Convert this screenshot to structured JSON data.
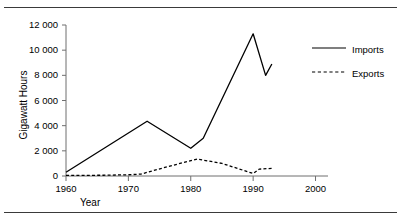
{
  "figure": {
    "top_rule": "",
    "bottom_rule": ""
  },
  "chart_data": {
    "type": "line",
    "title": "",
    "xlabel": "Year",
    "ylabel": "Gigawatt Hours",
    "xlim": [
      1960,
      2002
    ],
    "ylim": [
      0,
      12000
    ],
    "xticks": [
      1960,
      1970,
      1980,
      1990,
      2000
    ],
    "xtick_labels": [
      "1960",
      "1970",
      "1980",
      "1990",
      "2000"
    ],
    "yticks": [
      0,
      2000,
      4000,
      6000,
      8000,
      10000,
      12000
    ],
    "ytick_labels": [
      "0",
      "2 000",
      "4 000",
      "6 000",
      "8 000",
      "10 000",
      "12 000"
    ],
    "grid": false,
    "legend_position": "right",
    "line_color": "#000000",
    "axis_color": "#7a7a7a",
    "series": [
      {
        "name": "Imports",
        "style": "solid",
        "x": [
          1960,
          1973,
          1980,
          1982,
          1990,
          1992,
          1993
        ],
        "values": [
          300,
          4350,
          2200,
          3000,
          11300,
          8000,
          8900
        ]
      },
      {
        "name": "Exports",
        "style": "dashed",
        "x": [
          1960,
          1966,
          1970,
          1972,
          1976,
          1981,
          1985,
          1990,
          1991,
          1993
        ],
        "values": [
          50,
          60,
          100,
          150,
          700,
          1350,
          1000,
          200,
          550,
          600
        ]
      }
    ]
  },
  "legend": {
    "items": [
      {
        "label": "Imports",
        "style": "solid"
      },
      {
        "label": "Exports",
        "style": "dashed"
      }
    ]
  }
}
